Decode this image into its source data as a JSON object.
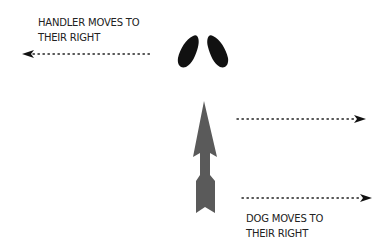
{
  "handler_label": {
    "line1": "HANDLER MOVES TO",
    "line2": "THEIR RIGHT"
  },
  "dog_label": {
    "line1": "DOG MOVES TO",
    "line2": "THEIR RIGHT"
  },
  "colors": {
    "footprints": "#111111",
    "dog_arrow": "#5a5a5a",
    "dotted_arrows": "#222222",
    "text": "#222222"
  },
  "arrows": {
    "handler_direction": "left",
    "dog_direction": "right"
  }
}
